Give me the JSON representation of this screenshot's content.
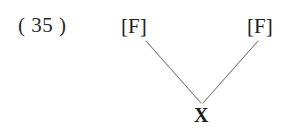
{
  "figure": {
    "example_number": "( 35 )",
    "caption": "",
    "background_color": "#ffffff",
    "edge_color": "#7d7d7d",
    "text_color": "#1d1d1d"
  },
  "tree": {
    "root": {
      "id": "root-x",
      "label": "X",
      "name": "root-node"
    },
    "children": [
      {
        "id": "left-f",
        "label": "[F]",
        "name": "left-feature-node"
      },
      {
        "id": "right-f",
        "label": "[F]",
        "name": "right-feature-node"
      }
    ],
    "edges": [
      {
        "from": "left-f",
        "to": "root-x",
        "x1": 146,
        "y1": 41,
        "x2": 201,
        "y2": 103
      },
      {
        "from": "right-f",
        "to": "root-x",
        "x1": 258,
        "y1": 41,
        "x2": 203,
        "y2": 103
      }
    ]
  }
}
